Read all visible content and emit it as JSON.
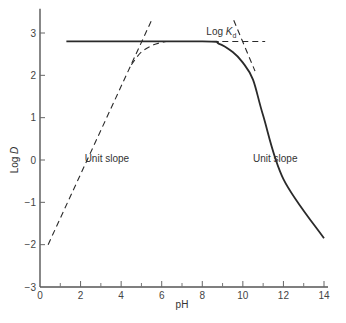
{
  "chart_data": {
    "type": "line",
    "title": "",
    "xlabel": "pH",
    "ylabel": "Log D",
    "xlim": [
      0,
      14
    ],
    "ylim": [
      -3,
      3.5
    ],
    "grid": false,
    "x_ticks": [
      0,
      2,
      4,
      6,
      8,
      10,
      12,
      14
    ],
    "x_minor_ticks": [
      1,
      3,
      5,
      7,
      9,
      11,
      13
    ],
    "y_ticks": [
      -3,
      -2,
      -1,
      0,
      1,
      2,
      3
    ],
    "annotations": [
      {
        "text": "Log K",
        "subscript": "d",
        "x": 8.2,
        "y": 2.95
      },
      {
        "text": "Unit slope",
        "x": 2.2,
        "y": -0.05
      },
      {
        "text": "Unit slope",
        "x": 10.5,
        "y": -0.05
      }
    ],
    "series": [
      {
        "name": "Log D (observed)",
        "style": "solid",
        "points": [
          [
            1.3,
            2.8
          ],
          [
            8.0,
            2.8
          ],
          [
            8.8,
            2.75
          ],
          [
            9.5,
            2.55
          ],
          [
            10.0,
            2.3
          ],
          [
            10.5,
            1.9
          ],
          [
            11.0,
            1.05
          ],
          [
            12.0,
            -0.45
          ],
          [
            14.0,
            -1.85
          ]
        ]
      },
      {
        "name": "Log K_d asymptote",
        "style": "dashed",
        "points": [
          [
            8.0,
            2.8
          ],
          [
            11.1,
            2.8
          ]
        ]
      },
      {
        "name": "Left unit-slope asymptote",
        "style": "dashed",
        "points": [
          [
            0.4,
            -2.0
          ],
          [
            5.5,
            3.3
          ]
        ]
      },
      {
        "name": "Left curved approach",
        "style": "dashed",
        "points": [
          [
            4.5,
            2.25
          ],
          [
            5.0,
            2.55
          ],
          [
            5.6,
            2.72
          ],
          [
            6.2,
            2.8
          ]
        ]
      },
      {
        "name": "Right unit-slope asymptote",
        "style": "dashed",
        "points": [
          [
            9.55,
            3.3
          ],
          [
            10.6,
            2.1
          ]
        ]
      }
    ]
  }
}
